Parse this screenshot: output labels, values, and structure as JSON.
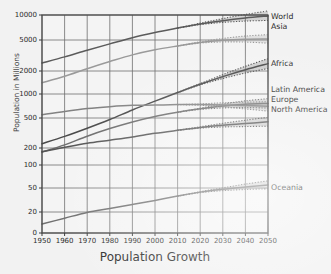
{
  "chart_data": {
    "type": "line",
    "title": "Population Growth",
    "xlabel": "Population Growth",
    "ylabel": "Population in Millions",
    "yscale": "log",
    "ylim": [
      10,
      13000
    ],
    "xlim": [
      1950,
      2050
    ],
    "grid": true,
    "legend_position": "right-inline",
    "x": [
      1950,
      1960,
      1970,
      1980,
      1990,
      2000,
      2010,
      2020,
      2030,
      2040,
      2050
    ],
    "x_ticklabels": [
      "1950",
      "1960",
      "1970",
      "1980",
      "1990",
      "2000",
      "2010",
      "2020",
      "2030",
      "2040",
      "2050"
    ],
    "y_ticklabels": [
      "0",
      "20",
      "50",
      "100",
      "200",
      "500",
      "1000",
      "2000",
      "5000",
      "10000"
    ],
    "y_tickvalues": [
      0,
      20,
      50,
      100,
      200,
      500,
      1000,
      2000,
      5000,
      10000
    ],
    "projection_start_year": 2010,
    "series": [
      {
        "name": "World",
        "color": "#5b5b5b",
        "values": [
          2536,
          3035,
          3700,
          4458,
          5331,
          6144,
          6957,
          7795,
          8548,
          9199,
          9735
        ],
        "upper": [
          2536,
          3035,
          3700,
          4458,
          5331,
          6144,
          6957,
          7980,
          9050,
          10150,
          11200
        ],
        "lower": [
          2536,
          3035,
          3700,
          4458,
          5331,
          6144,
          6957,
          7650,
          8150,
          8450,
          8600
        ]
      },
      {
        "name": "Asia",
        "color": "#9a9a9a",
        "values": [
          1405,
          1706,
          2142,
          2643,
          3221,
          3741,
          4194,
          4641,
          4947,
          5098,
          5143
        ],
        "upper": [
          1405,
          1706,
          2142,
          2643,
          3221,
          3741,
          4194,
          4740,
          5220,
          5580,
          5800
        ],
        "lower": [
          1405,
          1706,
          2142,
          2643,
          3221,
          3741,
          4194,
          4560,
          4720,
          4700,
          4560
        ]
      },
      {
        "name": "Africa",
        "color": "#4a4a4a",
        "values": [
          228,
          285,
          366,
          478,
          631,
          814,
          1044,
          1341,
          1688,
          2077,
          2489
        ],
        "upper": [
          228,
          285,
          366,
          478,
          631,
          814,
          1044,
          1368,
          1790,
          2300,
          2880
        ],
        "lower": [
          228,
          285,
          366,
          478,
          631,
          814,
          1044,
          1316,
          1595,
          1880,
          2150
        ]
      },
      {
        "name": "Latin America",
        "color": "#6e6e6e",
        "values": [
          169,
          220,
          287,
          362,
          443,
          522,
          591,
          652,
          706,
          744,
          762
        ],
        "upper": [
          169,
          220,
          287,
          362,
          443,
          522,
          591,
          665,
          748,
          820,
          875
        ],
        "lower": [
          169,
          220,
          287,
          362,
          443,
          522,
          591,
          640,
          668,
          676,
          665
        ]
      },
      {
        "name": "Europe",
        "color": "#828282",
        "values": [
          549,
          605,
          657,
          694,
          721,
          726,
          736,
          736,
          729,
          716,
          700
        ],
        "upper": [
          549,
          605,
          657,
          694,
          721,
          726,
          736,
          752,
          775,
          790,
          800
        ],
        "lower": [
          549,
          605,
          657,
          694,
          721,
          726,
          736,
          720,
          690,
          650,
          610
        ]
      },
      {
        "name": "North America",
        "color": "#565656",
        "values": [
          172,
          204,
          231,
          254,
          280,
          313,
          343,
          375,
          401,
          422,
          446
        ],
        "upper": [
          172,
          204,
          231,
          254,
          280,
          313,
          343,
          383,
          425,
          468,
          510
        ],
        "lower": [
          172,
          204,
          231,
          254,
          280,
          313,
          343,
          367,
          380,
          385,
          390
        ]
      },
      {
        "name": "Oceania",
        "color": "#707070",
        "values": [
          12.6,
          15.8,
          19.7,
          22.9,
          26.7,
          31.1,
          36.7,
          42.7,
          47.6,
          51.5,
          54.9
        ],
        "upper": [
          12.6,
          15.8,
          19.7,
          22.9,
          26.7,
          31.1,
          36.7,
          43.6,
          50.2,
          56.3,
          62.0
        ],
        "lower": [
          12.6,
          15.8,
          19.7,
          22.9,
          26.7,
          31.1,
          36.7,
          41.8,
          45.2,
          47.2,
          48.5
        ]
      }
    ],
    "series_label_positions": [
      {
        "name": "World",
        "x": 271,
        "y": 12
      },
      {
        "name": "Asia",
        "x": 271,
        "y": 22
      },
      {
        "name": "Africa",
        "x": 271,
        "y": 59
      },
      {
        "name": "Latin America",
        "x": 271,
        "y": 85
      },
      {
        "name": "Europe",
        "x": 271,
        "y": 95
      },
      {
        "name": "North America",
        "x": 271,
        "y": 105
      },
      {
        "name": "Oceania",
        "x": 271,
        "y": 183
      }
    ]
  }
}
